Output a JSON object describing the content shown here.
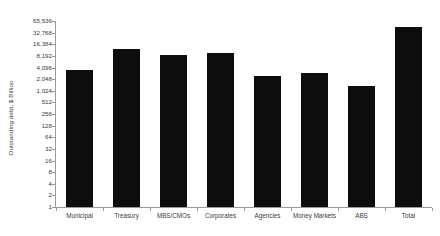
{
  "chart_data": {
    "type": "bar",
    "title": "",
    "xlabel": "",
    "ylabel": "Outstanding debt, $ Billion",
    "yscale": "log2",
    "ylim": [
      1,
      65536
    ],
    "grid": false,
    "legend": null,
    "categories": [
      "Municipal",
      "Treasury",
      "MBS/CMOs",
      "Corporates",
      "Agencies",
      "Money Markets",
      "ABS",
      "Total"
    ],
    "values": [
      3500,
      12000,
      8500,
      10000,
      2400,
      2900,
      1400,
      45000
    ],
    "ytick_labels": [
      "1",
      "2",
      "4",
      "8",
      "16",
      "32",
      "64",
      "128",
      "256",
      "512",
      "1,024",
      "2,048",
      "4,096",
      "8,192",
      "16,384",
      "32,768",
      "65,536"
    ],
    "ytick_values": [
      1,
      2,
      4,
      8,
      16,
      32,
      64,
      128,
      256,
      512,
      1024,
      2048,
      4096,
      8192,
      16384,
      32768,
      65536
    ],
    "bar_color": "#0d0d0d",
    "axis_color": "#9a9a9a",
    "text_color": "#3a3a3a",
    "background_color": "#ffffff"
  }
}
